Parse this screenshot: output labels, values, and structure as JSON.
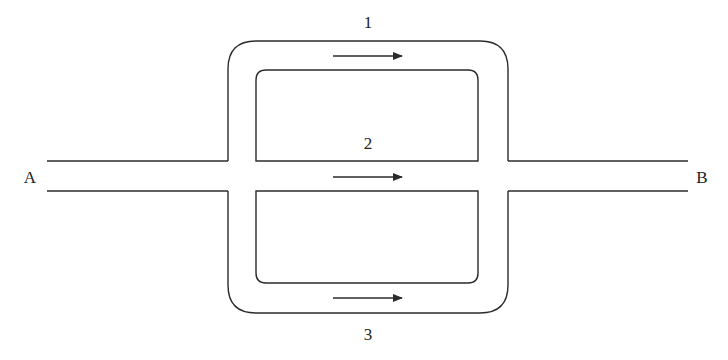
{
  "diagram": {
    "type": "parallel-paths-network",
    "endpoints": {
      "start": {
        "label": "A"
      },
      "end": {
        "label": "B"
      }
    },
    "paths": [
      {
        "id": 1,
        "label": "1",
        "position": "top",
        "direction": "right"
      },
      {
        "id": 2,
        "label": "2",
        "position": "middle",
        "direction": "right"
      },
      {
        "id": 3,
        "label": "3",
        "position": "bottom",
        "direction": "right"
      }
    ],
    "colors": {
      "stroke": "#2b2b2b",
      "text": "#222222",
      "background": "#ffffff"
    }
  }
}
